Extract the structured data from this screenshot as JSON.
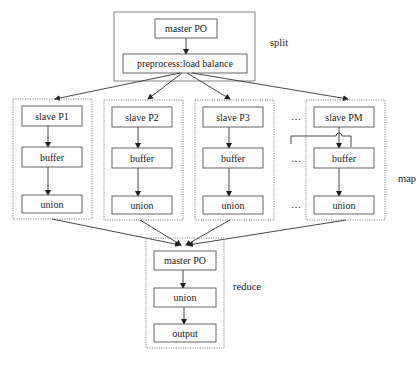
{
  "split": {
    "label": "split",
    "master": "master PO",
    "preprocess": "preprocess:load balance"
  },
  "map": {
    "label": "map",
    "ellipsis": "…",
    "workers": [
      {
        "slave": "slave P1",
        "buffer": "buffer",
        "union": "union"
      },
      {
        "slave": "slave P2",
        "buffer": "buffer",
        "union": "union"
      },
      {
        "slave": "slave P3",
        "buffer": "buffer",
        "union": "union"
      },
      {
        "slave": "slave PM",
        "buffer": "buffer",
        "union": "union"
      }
    ]
  },
  "reduce": {
    "label": "reduce",
    "master": "master PO",
    "union": "union",
    "output": "output"
  }
}
